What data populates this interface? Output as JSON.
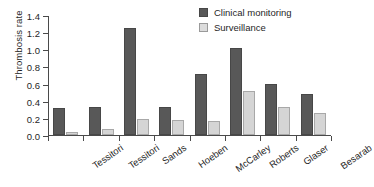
{
  "chart_data": {
    "type": "bar",
    "title": "",
    "xlabel": "",
    "ylabel": "Thrombosis rate",
    "ylim": [
      0.0,
      1.4
    ],
    "ytick_labels": [
      "0.0",
      "0.2",
      "0.4",
      "0.6",
      "0.8",
      "1.0",
      "1.2",
      "1.4"
    ],
    "ytick_values": [
      0.0,
      0.2,
      0.4,
      0.6,
      0.8,
      1.0,
      1.2,
      1.4
    ],
    "grid": false,
    "legend_position": "top-right",
    "categories": [
      "Tessitori",
      "Tessitori",
      "Sands",
      "Hoeben",
      "McCarley",
      "Roberts",
      "Glaser",
      "Besarab"
    ],
    "series": [
      {
        "name": "Clinical monitoring",
        "color": "#585858",
        "values": [
          0.31,
          0.33,
          1.25,
          0.33,
          0.71,
          1.02,
          0.6,
          0.48
        ]
      },
      {
        "name": "Surveillance",
        "color": "#d5d5d5",
        "values": [
          0.03,
          0.07,
          0.19,
          0.17,
          0.16,
          0.51,
          0.33,
          0.26
        ]
      }
    ]
  },
  "legend": {
    "items": [
      {
        "label": "Clinical monitoring",
        "swatch": "clinical"
      },
      {
        "label": "Surveillance",
        "swatch": "surveillance"
      }
    ]
  }
}
